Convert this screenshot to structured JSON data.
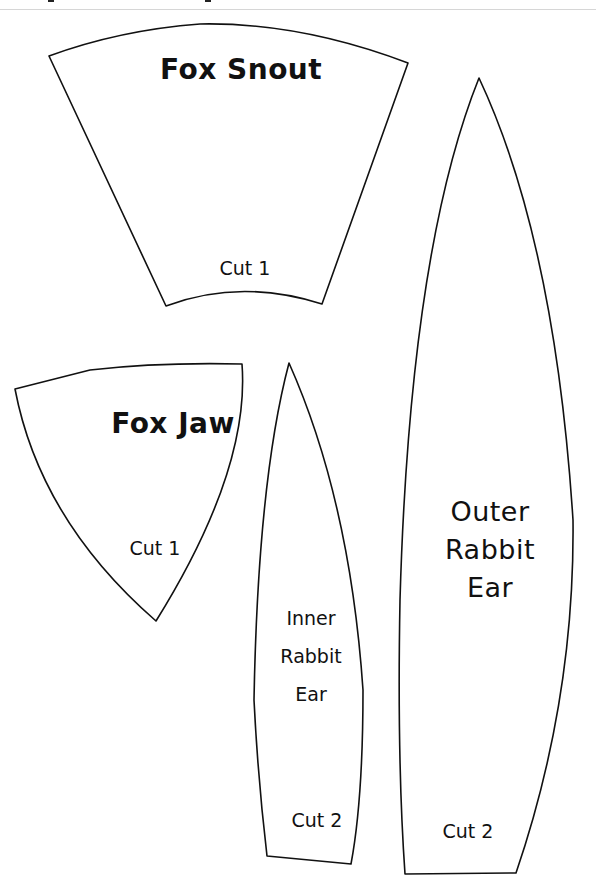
{
  "page": {
    "background": "#ffffff",
    "line_color": "#111111"
  },
  "pieces": [
    {
      "id": "fox-snout",
      "title": "Fox Snout",
      "cut": "Cut 1"
    },
    {
      "id": "fox-jaw",
      "title": "Fox Jaw",
      "cut": "Cut 1"
    },
    {
      "id": "inner-rabbit-ear",
      "title_lines": [
        "Inner",
        "Rabbit",
        "Ear"
      ],
      "cut": "Cut 2"
    },
    {
      "id": "outer-rabbit-ear",
      "title_lines": [
        "Outer",
        "Rabbit",
        "Ear"
      ],
      "cut": "Cut 2"
    }
  ]
}
